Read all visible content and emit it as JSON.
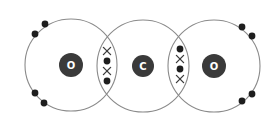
{
  "diagram": {
    "colors": {
      "shell": "#8a8a8a",
      "nucleus": "#3a3a3a",
      "nucleus_text": "#ffffff",
      "electron_dot": "#1e1e1e",
      "electron_cross": "#3a3a3a"
    },
    "atoms": [
      {
        "id": "oxygen-left",
        "symbol": "O",
        "cx": 71,
        "cy": 65,
        "r": 46,
        "nucleus_r": 12
      },
      {
        "id": "carbon",
        "symbol": "C",
        "cx": 143,
        "cy": 66,
        "r": 46,
        "nucleus_r": 11
      },
      {
        "id": "oxygen-right",
        "symbol": "O",
        "cx": 214,
        "cy": 66,
        "r": 46,
        "nucleus_r": 12
      }
    ],
    "lone_pairs": [
      {
        "atom": "oxygen-left",
        "position": "upper-left",
        "electrons": [
          [
            35,
            34
          ],
          [
            45,
            24
          ]
        ]
      },
      {
        "atom": "oxygen-left",
        "position": "lower-left",
        "electrons": [
          [
            35,
            93
          ],
          [
            44,
            103
          ]
        ]
      },
      {
        "atom": "oxygen-right",
        "position": "upper-right",
        "electrons": [
          [
            242,
            27
          ],
          [
            252,
            36
          ]
        ]
      },
      {
        "atom": "oxygen-right",
        "position": "lower-right",
        "electrons": [
          [
            242,
            101
          ],
          [
            252,
            94
          ]
        ]
      }
    ],
    "bonds": [
      {
        "between": [
          "oxygen-left",
          "carbon"
        ],
        "type": "double",
        "electrons": [
          {
            "kind": "cross",
            "x": 107,
            "y": 51
          },
          {
            "kind": "dot",
            "x": 107,
            "y": 61
          },
          {
            "kind": "cross",
            "x": 107,
            "y": 71
          },
          {
            "kind": "dot",
            "x": 107,
            "y": 81
          }
        ]
      },
      {
        "between": [
          "carbon",
          "oxygen-right"
        ],
        "type": "double",
        "electrons": [
          {
            "kind": "dot",
            "x": 180,
            "y": 49
          },
          {
            "kind": "cross",
            "x": 180,
            "y": 59
          },
          {
            "kind": "dot",
            "x": 180,
            "y": 69
          },
          {
            "kind": "cross",
            "x": 180,
            "y": 79
          }
        ]
      }
    ]
  }
}
